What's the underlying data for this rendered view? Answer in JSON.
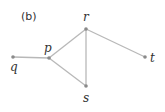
{
  "figure": {
    "label": "(b)"
  },
  "graph": {
    "edge_color": "#b8b8b8",
    "node_color": "#8a8a8a",
    "nodes": [
      {
        "id": "q",
        "label": "q",
        "x": 13,
        "y": 57
      },
      {
        "id": "p",
        "label": "p",
        "x": 49,
        "y": 58
      },
      {
        "id": "r",
        "label": "r",
        "x": 86,
        "y": 29
      },
      {
        "id": "s",
        "label": "s",
        "x": 86,
        "y": 86
      },
      {
        "id": "t",
        "label": "t",
        "x": 145,
        "y": 57
      }
    ],
    "edges": [
      [
        "q",
        "p"
      ],
      [
        "p",
        "r"
      ],
      [
        "p",
        "s"
      ],
      [
        "r",
        "s"
      ],
      [
        "r",
        "t"
      ]
    ]
  }
}
